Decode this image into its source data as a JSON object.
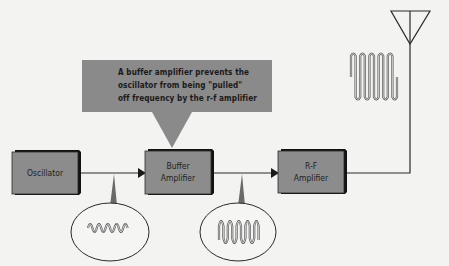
{
  "diagram": {
    "callout": {
      "lines": [
        "A buffer amplifier prevents the",
        "oscillator from being \"pulled\"",
        "off frequency by the r-f amplifier"
      ]
    },
    "blocks": [
      {
        "id": "oscillator",
        "label_lines": [
          "Oscillator"
        ]
      },
      {
        "id": "buffer-amplifier",
        "label_lines": [
          "Buffer",
          "Amplifier"
        ]
      },
      {
        "id": "rf-amplifier",
        "label_lines": [
          "R-F",
          "Amplifier"
        ]
      }
    ],
    "waveforms": [
      {
        "id": "oscillator-output",
        "description": "small amplitude sine wave"
      },
      {
        "id": "buffer-output",
        "description": "larger amplitude sine wave"
      },
      {
        "id": "antenna-output",
        "description": "large amplitude sine wave"
      }
    ],
    "antenna": {
      "symbol": "antenna-icon"
    },
    "colors": {
      "background": "#f3f3f1",
      "block_fill": "#8c8c8c",
      "block_shadow": "#121212",
      "callout_fill": "#8a8a8a",
      "line": "#2a2a2a"
    }
  }
}
